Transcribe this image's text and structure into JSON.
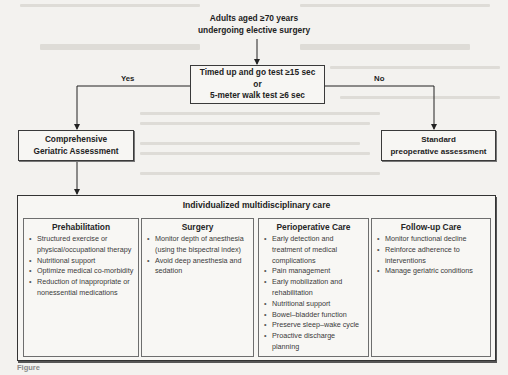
{
  "start": {
    "line1": "Adults aged ≥70 years",
    "line2": "undergoing elective surgery"
  },
  "decision": {
    "line1": "Timed up and go test ≥15 sec",
    "line2": "or",
    "line3": "5-meter walk test ≥6 sec"
  },
  "branches": {
    "yes_label": "Yes",
    "no_label": "No"
  },
  "yes_outcome": {
    "line1": "Comprehensive",
    "line2": "Geriatric Assessment"
  },
  "no_outcome": {
    "line1": "Standard",
    "line2": "preoperative assessment"
  },
  "care": {
    "title": "Individualized multidisciplinary care",
    "columns": [
      {
        "heading": "Prehabilitation",
        "items": [
          "Structured exercise or physical/occupational therapy",
          "Nutritional support",
          "Optimize medical co-morbidity",
          "Reduction of inappropriate or nonessential medications"
        ]
      },
      {
        "heading": "Surgery",
        "items": [
          "Monitor depth of anesthesia (using the bispectral index)",
          "Avoid deep anesthesia and sedation"
        ]
      },
      {
        "heading": "Perioperative Care",
        "items": [
          "Early detection and treatment of medical complications",
          "Pain management",
          "Early mobilization and rehabilitation",
          "Nutritional support",
          "Bowel–bladder function",
          "Preserve sleep–wake cycle",
          "Proactive discharge planning"
        ]
      },
      {
        "heading": "Follow-up Care",
        "items": [
          "Monitor functional decline",
          "Reinforce adherence to interventions",
          "Manage geriatric conditions"
        ]
      }
    ]
  },
  "caption": "Figure"
}
